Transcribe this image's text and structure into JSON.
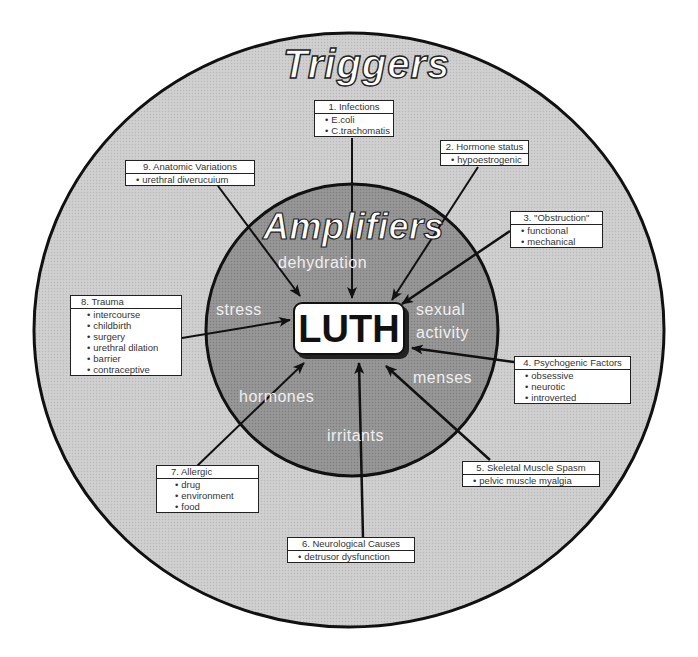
{
  "diagram": {
    "outer_label": "Triggers",
    "inner_label": "Amplifiers",
    "center_label": "LUTH",
    "colors": {
      "outer_fill": "#c9c9c9",
      "inner_fill": "#8f8f8f",
      "stroke": "#111111",
      "box_fill": "#ffffff"
    },
    "amplifiers": [
      {
        "label": "dehydration"
      },
      {
        "label": "stress"
      },
      {
        "label": "sexual"
      },
      {
        "label": "activity"
      },
      {
        "label": "menses"
      },
      {
        "label": "hormones"
      },
      {
        "label": "irritants"
      }
    ],
    "triggers": [
      {
        "title": "1. Infections",
        "items": [
          "E.coli",
          "C.trachomatis"
        ]
      },
      {
        "title": "2. Hormone status",
        "items": [
          "hypoestrogenic"
        ]
      },
      {
        "title": "3. \"Obstruction\"",
        "items": [
          "functional",
          "mechanical"
        ]
      },
      {
        "title": "4. Psychogenic Factors",
        "items": [
          "obsessive",
          "neurotic",
          "introverted"
        ]
      },
      {
        "title": "5. Skeletal Muscle Spasm",
        "items": [
          "pelvic muscle myalgia"
        ]
      },
      {
        "title": "6. Neurological Causes",
        "items": [
          "detrusor dysfunction"
        ]
      },
      {
        "title": "7. Allergic",
        "items": [
          "drug",
          "environment",
          "food"
        ]
      },
      {
        "title": "8. Trauma",
        "items": [
          "intercourse",
          "childbirth",
          "surgery",
          "urethral dilation",
          "barrier",
          "contraceptive"
        ]
      },
      {
        "title": "9. Anatomic Variations",
        "items": [
          "urethral diverucuium"
        ]
      }
    ]
  }
}
